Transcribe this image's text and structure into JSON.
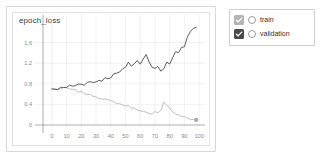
{
  "card": {
    "title": "epoch_loss"
  },
  "legend": {
    "position": "right",
    "items": [
      {
        "label": "train",
        "checked": true,
        "checkbox_color": "#b5b5b5",
        "marker": "circle-outline",
        "icon": "checkbox-checked-icon"
      },
      {
        "label": "validation",
        "checked": true,
        "checkbox_color": "#4a4a4a",
        "marker": "circle-outline",
        "icon": "checkbox-checked-icon"
      }
    ]
  },
  "chart_data": {
    "type": "line",
    "title": "epoch_loss",
    "xlabel": "",
    "ylabel": "",
    "xlim": [
      -6,
      104
    ],
    "ylim": [
      -0.12,
      2.02
    ],
    "grid": true,
    "xticks": [
      0,
      10,
      20,
      30,
      40,
      50,
      60,
      70,
      80,
      90,
      100
    ],
    "yticks": [
      0,
      0.4,
      0.8,
      1.2,
      1.6
    ],
    "ytick_labels": [
      "0",
      "0.4",
      "0.8",
      "1.2",
      "1.6"
    ],
    "colors": {
      "train": "#b9b9b9",
      "validation": "#4c4c4c"
    },
    "x": [
      0,
      2,
      4,
      6,
      8,
      10,
      12,
      14,
      16,
      18,
      20,
      22,
      24,
      26,
      28,
      30,
      32,
      34,
      36,
      38,
      40,
      42,
      44,
      46,
      48,
      50,
      52,
      54,
      56,
      58,
      60,
      62,
      64,
      66,
      68,
      70,
      72,
      74,
      76,
      78,
      80,
      82,
      84,
      86,
      88,
      90,
      92,
      94,
      96,
      98
    ],
    "series": [
      {
        "name": "train",
        "color": "#b9b9b9",
        "end_marker": true,
        "values": [
          0.7,
          0.7,
          0.7,
          0.7,
          0.71,
          0.72,
          0.7,
          0.68,
          0.67,
          0.65,
          0.64,
          0.62,
          0.6,
          0.58,
          0.57,
          0.55,
          0.53,
          0.52,
          0.5,
          0.48,
          0.46,
          0.45,
          0.43,
          0.41,
          0.39,
          0.38,
          0.36,
          0.34,
          0.32,
          0.3,
          0.29,
          0.26,
          0.24,
          0.21,
          0.2,
          0.25,
          0.23,
          0.3,
          0.45,
          0.4,
          0.32,
          0.26,
          0.22,
          0.19,
          0.17,
          0.15,
          0.13,
          0.12,
          0.11,
          0.1
        ]
      },
      {
        "name": "validation",
        "color": "#4c4c4c",
        "end_marker": false,
        "values": [
          0.7,
          0.7,
          0.7,
          0.71,
          0.72,
          0.74,
          0.76,
          0.75,
          0.77,
          0.79,
          0.81,
          0.8,
          0.82,
          0.84,
          0.83,
          0.85,
          0.87,
          0.88,
          0.9,
          0.92,
          0.94,
          0.97,
          1.0,
          1.02,
          1.06,
          1.14,
          1.22,
          1.15,
          1.18,
          1.24,
          1.2,
          1.3,
          1.36,
          1.26,
          1.14,
          1.08,
          1.12,
          1.05,
          1.1,
          1.22,
          1.2,
          1.32,
          1.4,
          1.42,
          1.5,
          1.55,
          1.68,
          1.8,
          1.88,
          1.92
        ]
      }
    ]
  }
}
